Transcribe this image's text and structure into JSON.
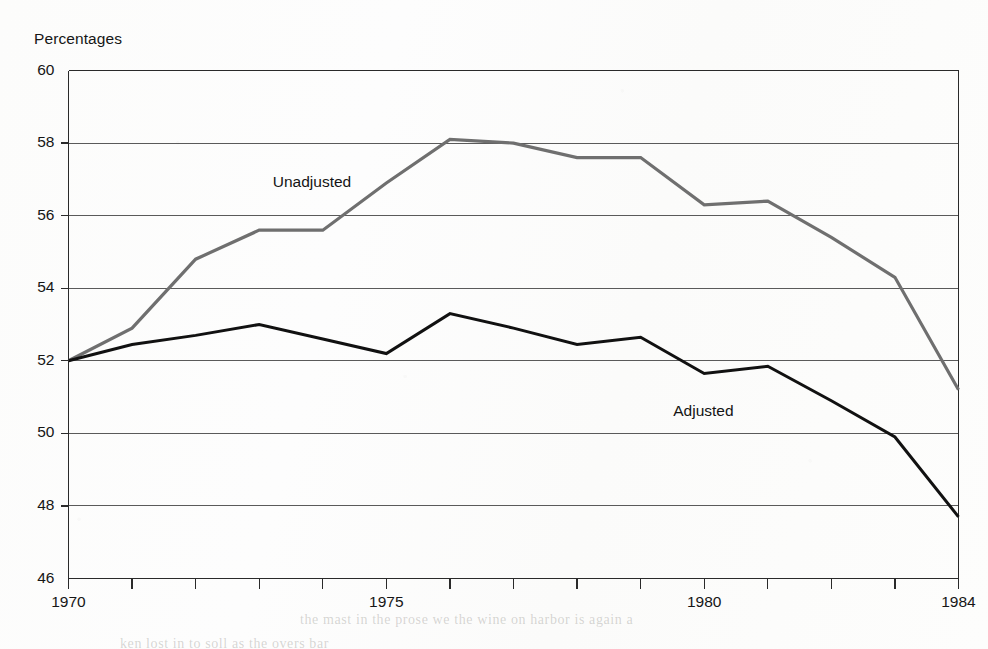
{
  "chart_data": {
    "type": "line",
    "title": "",
    "subtitle": "",
    "ylabel": "Percentages",
    "xlabel": "",
    "ylim": [
      46,
      60
    ],
    "xlim": [
      1970,
      1984
    ],
    "yticks": [
      46,
      48,
      50,
      52,
      54,
      56,
      58,
      60
    ],
    "ytick_labels": [
      "46",
      "48",
      "50",
      "52",
      "54",
      "56",
      "58",
      "60"
    ],
    "xticks": [
      1970,
      1971,
      1972,
      1973,
      1974,
      1975,
      1976,
      1977,
      1978,
      1979,
      1980,
      1981,
      1982,
      1983,
      1984
    ],
    "xtick_labels_shown": [
      "1970",
      "1975",
      "1980",
      "1984"
    ],
    "xtick_labels_shown_values": [
      1970,
      1975,
      1980,
      1984
    ],
    "grid": "horizontal",
    "legend_position": "inline-annotations",
    "x": [
      1970,
      1971,
      1972,
      1973,
      1974,
      1975,
      1976,
      1977,
      1978,
      1979,
      1980,
      1981,
      1982,
      1983,
      1984
    ],
    "series": [
      {
        "name": "Unadjusted",
        "color": "#6f6f6f",
        "values": [
          52.0,
          52.9,
          54.8,
          55.6,
          55.6,
          56.9,
          58.1,
          58.0,
          57.6,
          57.6,
          56.3,
          56.4,
          55.4,
          54.3,
          51.2
        ]
      },
      {
        "name": "Adjusted",
        "color": "#111111",
        "values": [
          52.0,
          52.45,
          52.7,
          53.0,
          52.6,
          52.2,
          53.3,
          52.9,
          52.45,
          52.65,
          51.65,
          51.85,
          50.9,
          49.9,
          47.7
        ]
      }
    ],
    "annotations": [
      {
        "text": "Unadjusted",
        "x": 1974.0,
        "y": 56.9
      },
      {
        "text": "Adjusted",
        "x": 1980.3,
        "y": 50.6
      }
    ]
  },
  "colors": {
    "unadjusted_line": "#6f6f6f",
    "adjusted_line": "#111111",
    "gridline": "#5a5a5a",
    "frame": "#2a2a2a",
    "text": "#161616",
    "background": "#fdfdfc"
  },
  "bleed_text": [
    "the mast in the prose we the wine on harbor is again a",
    "ken lost in to soll as the overs bar"
  ]
}
